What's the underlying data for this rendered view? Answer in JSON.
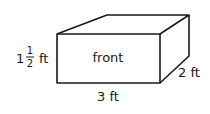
{
  "diagram": {
    "type": "rectangular-prism",
    "face_label": "front",
    "dimensions": {
      "height": {
        "whole": "1",
        "numerator": "1",
        "denominator": "2",
        "unit": "ft"
      },
      "length": "3 ft",
      "depth": "2 ft"
    },
    "colors": {
      "stroke": "#1a1a1a",
      "background": "#ffffff"
    }
  }
}
